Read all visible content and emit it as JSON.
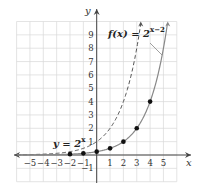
{
  "chart_data": {
    "type": "line",
    "title": "",
    "xlabel": "x",
    "ylabel": "y",
    "xlim": [
      -6,
      6
    ],
    "ylim": [
      -2,
      10
    ],
    "grid": true,
    "x_ticks": [
      "-5",
      "-4",
      "-3",
      "-2",
      "-1",
      "1",
      "2",
      "3",
      "4",
      "5"
    ],
    "y_ticks": [
      "-1",
      "1",
      "2",
      "3",
      "4",
      "5",
      "6",
      "7",
      "8",
      "9"
    ],
    "series": [
      {
        "name": "y = 2^x",
        "style": "dashed",
        "label_text": "y = 2",
        "label_exp": "x",
        "x": [
          -6,
          -5,
          -4,
          -3,
          -2,
          -1,
          0,
          1,
          2,
          3,
          3.3
        ],
        "y": [
          0.016,
          0.031,
          0.0625,
          0.125,
          0.25,
          0.5,
          1,
          2,
          4,
          8,
          9.85
        ]
      },
      {
        "name": "f(x) = 2^(x-2)",
        "style": "solid",
        "label_text": "f(x) = 2",
        "label_exp": "x−2",
        "points": [
          {
            "x": -2,
            "y": 0.0625
          },
          {
            "x": -1,
            "y": 0.125
          },
          {
            "x": 0,
            "y": 0.25
          },
          {
            "x": 1,
            "y": 0.5
          },
          {
            "x": 2,
            "y": 1
          },
          {
            "x": 3,
            "y": 2
          },
          {
            "x": 4,
            "y": 4
          }
        ],
        "x": [
          -6,
          -5,
          -4,
          -3,
          -2,
          -1,
          0,
          1,
          2,
          3,
          4,
          5,
          5.3
        ],
        "y": [
          0.004,
          0.008,
          0.016,
          0.031,
          0.0625,
          0.125,
          0.25,
          0.5,
          1,
          2,
          4,
          8,
          9.85
        ]
      }
    ]
  },
  "labels": {
    "x_axis": "x",
    "y_axis": "y",
    "f_label_main": "f(x) = 2",
    "f_label_exp": "x−2",
    "g_label_main": "y = 2",
    "g_label_exp": "x"
  },
  "colors": {
    "grid": "#d9d9d9",
    "axis": "#444444",
    "curve_solid": "#888888",
    "curve_dashed": "#555555",
    "points": "#111111"
  }
}
